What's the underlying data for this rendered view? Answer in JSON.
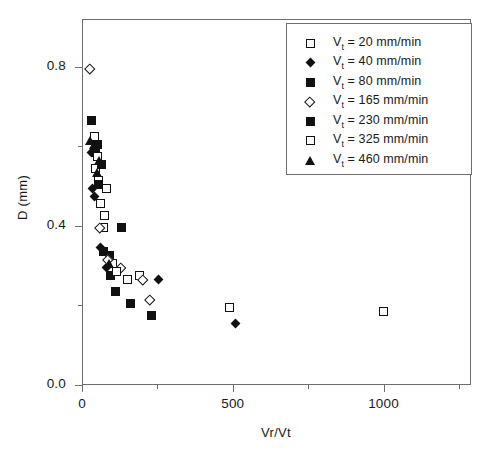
{
  "chart_data": {
    "type": "scatter",
    "title": "",
    "xlabel": "Vr/Vt",
    "ylabel": "D (mm)",
    "xlim": [
      0,
      1290
    ],
    "ylim": [
      0,
      0.92
    ],
    "xticks": [
      0,
      500,
      1000
    ],
    "xtick_labels": [
      "0",
      "500",
      "1000"
    ],
    "xminor_ticks": [
      250,
      750,
      1250
    ],
    "yticks": [
      0.0,
      0.4,
      0.8
    ],
    "ytick_labels": [
      "0.0",
      "0.4",
      "0.8"
    ],
    "yminor_ticks": [
      0.2,
      0.6
    ],
    "grid": false,
    "legend_position": "top-right",
    "series": [
      {
        "name": "Vt = 20 mm/min",
        "label_prefix": "V",
        "label_sub": "t",
        "label_suffix": " = 20 mm/min",
        "marker": "square-open",
        "points": [
          {
            "x": 40,
            "y": 0.625
          },
          {
            "x": 45,
            "y": 0.545
          },
          {
            "x": 55,
            "y": 0.515
          },
          {
            "x": 60,
            "y": 0.455
          },
          {
            "x": 75,
            "y": 0.425
          },
          {
            "x": 70,
            "y": 0.395
          },
          {
            "x": 100,
            "y": 0.305
          },
          {
            "x": 150,
            "y": 0.265
          },
          {
            "x": 190,
            "y": 0.275
          },
          {
            "x": 490,
            "y": 0.195
          },
          {
            "x": 1000,
            "y": 0.185
          }
        ]
      },
      {
        "name": "Vt = 40 mm/min",
        "label_prefix": "V",
        "label_sub": "t",
        "label_suffix": " = 40 mm/min",
        "marker": "diamond-fill",
        "points": [
          {
            "x": 30,
            "y": 0.585
          },
          {
            "x": 35,
            "y": 0.495
          },
          {
            "x": 40,
            "y": 0.475
          },
          {
            "x": 60,
            "y": 0.345
          },
          {
            "x": 80,
            "y": 0.295
          },
          {
            "x": 255,
            "y": 0.265
          },
          {
            "x": 510,
            "y": 0.155
          }
        ]
      },
      {
        "name": "Vt = 80 mm/min",
        "label_prefix": "V",
        "label_sub": "t",
        "label_suffix": " = 80 mm/min",
        "marker": "square-fill",
        "points": [
          {
            "x": 30,
            "y": 0.665
          },
          {
            "x": 45,
            "y": 0.585
          },
          {
            "x": 55,
            "y": 0.505
          },
          {
            "x": 70,
            "y": 0.335
          },
          {
            "x": 90,
            "y": 0.325
          },
          {
            "x": 130,
            "y": 0.395
          },
          {
            "x": 110,
            "y": 0.235
          },
          {
            "x": 230,
            "y": 0.175
          }
        ]
      },
      {
        "name": "Vt = 165 mm/min",
        "label_prefix": "V",
        "label_sub": "t",
        "label_suffix": " = 165 mm/min",
        "marker": "diamond-open",
        "points": [
          {
            "x": 25,
            "y": 0.795
          },
          {
            "x": 60,
            "y": 0.395
          },
          {
            "x": 85,
            "y": 0.315
          },
          {
            "x": 130,
            "y": 0.295
          },
          {
            "x": 200,
            "y": 0.265
          },
          {
            "x": 225,
            "y": 0.215
          }
        ]
      },
      {
        "name": "Vt = 230 mm/min",
        "label_prefix": "V",
        "label_sub": "t",
        "label_suffix": " = 230 mm/min",
        "marker": "square-fill",
        "points": [
          {
            "x": 50,
            "y": 0.605
          },
          {
            "x": 65,
            "y": 0.555
          },
          {
            "x": 95,
            "y": 0.275
          },
          {
            "x": 160,
            "y": 0.205
          }
        ]
      },
      {
        "name": "Vt = 325 mm/min",
        "label_prefix": "V",
        "label_sub": "t",
        "label_suffix": " = 325 mm/min",
        "marker": "square-open",
        "points": [
          {
            "x": 50,
            "y": 0.575
          },
          {
            "x": 80,
            "y": 0.495
          },
          {
            "x": 115,
            "y": 0.285
          }
        ]
      },
      {
        "name": "Vt = 460 mm/min",
        "label_prefix": "V",
        "label_sub": "t",
        "label_suffix": " = 460 mm/min",
        "marker": "triangle-fill",
        "points": [
          {
            "x": 25,
            "y": 0.615
          },
          {
            "x": 40,
            "y": 0.605
          },
          {
            "x": 50,
            "y": 0.535
          },
          {
            "x": 55,
            "y": 0.565
          },
          {
            "x": 90,
            "y": 0.305
          }
        ]
      }
    ]
  }
}
